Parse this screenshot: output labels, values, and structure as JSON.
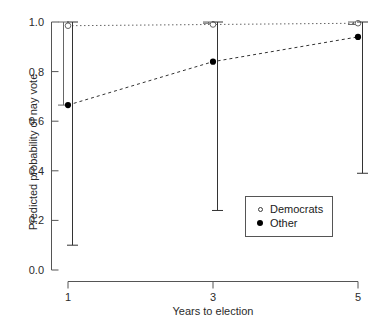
{
  "chart_data": {
    "type": "line",
    "title": "",
    "xlabel": "Years to election",
    "ylabel": "Predicted probability of nay vote",
    "x": [
      1,
      3,
      5
    ],
    "xtick_labels": [
      "1",
      "3",
      "5"
    ],
    "ytick_labels": [
      "0.0",
      "0.2",
      "0.4",
      "0.6",
      "0.8",
      "1.0"
    ],
    "ytick_values": [
      0.0,
      0.2,
      0.4,
      0.6,
      0.8,
      1.0
    ],
    "xlim": [
      1,
      5
    ],
    "ylim": [
      0.0,
      1.0
    ],
    "grid": false,
    "legend_position": "right-lower",
    "series": [
      {
        "name": "Democrats",
        "marker": "open-circle",
        "line_style": "dotted",
        "color": "#666666",
        "values": [
          0.985,
          0.99,
          0.995
        ],
        "ci_lower": [
          0.665,
          0.995,
          0.99
        ],
        "ci_upper": [
          1.0,
          1.0,
          1.0
        ]
      },
      {
        "name": "Other",
        "marker": "filled-circle",
        "line_style": "dashed",
        "color": "#333333",
        "values": [
          0.665,
          0.84,
          0.94
        ],
        "ci_lower": [
          0.1,
          0.24,
          0.39
        ],
        "ci_upper": [
          1.0,
          1.0,
          1.0
        ]
      }
    ]
  },
  "legend": {
    "entries": [
      {
        "label": "Democrats"
      },
      {
        "label": "Other"
      }
    ]
  },
  "axes": {
    "y_label": "Predicted probability of nay vote",
    "x_label": "Years to election"
  }
}
